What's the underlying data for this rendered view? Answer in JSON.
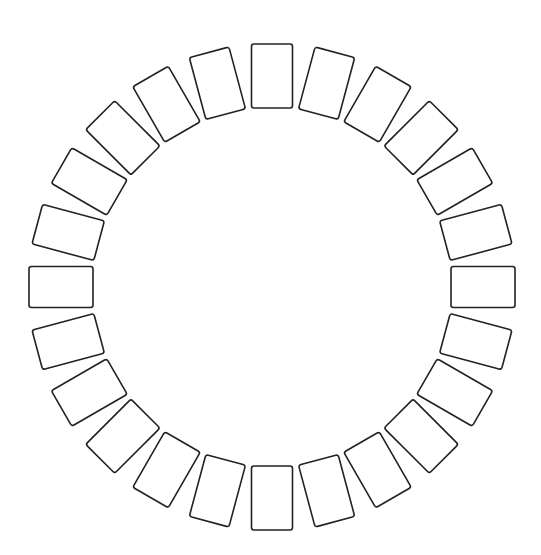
{
  "diagram": {
    "type": "radial-ring",
    "count": 24,
    "angle_step_deg": 15,
    "center": {
      "x": 272,
      "y": 287
    },
    "radius": 211,
    "item": {
      "width": 41,
      "height": 64,
      "corner_radius": 2.5
    },
    "stroke_color": "#222222",
    "stroke_width": 1.6,
    "fill_color": "#ffffff",
    "background": "#ffffff"
  }
}
